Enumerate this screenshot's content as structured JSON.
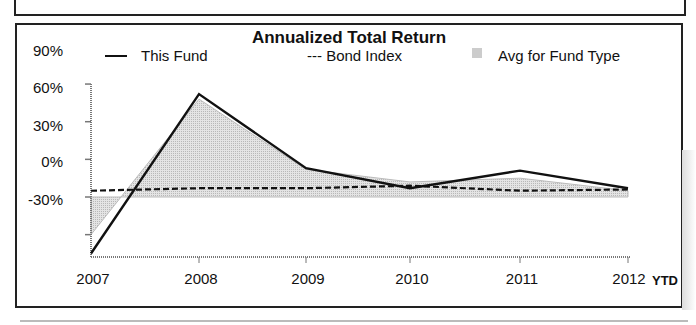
{
  "chart_data": {
    "type": "line",
    "title": "Annualized Total Return",
    "xlabel": "",
    "ylabel": "",
    "categories": [
      "2007",
      "2008",
      "2009",
      "2010",
      "2011",
      "2012"
    ],
    "x_suffix_label": "YTD",
    "yticks": [
      "90%",
      "60%",
      "30%",
      "0%",
      "-30%"
    ],
    "ylim": [
      -50,
      90
    ],
    "grid": false,
    "legend_position": "top",
    "series": [
      {
        "name": "This Fund",
        "style": "solid",
        "values": [
          -45,
          82,
          23,
          7,
          21,
          7
        ]
      },
      {
        "name": "Bond Index",
        "style": "dashed",
        "values": [
          5,
          7,
          7,
          9,
          5,
          6
        ]
      },
      {
        "name": "Avg for Fund Type",
        "style": "area",
        "values": [
          -30,
          78,
          22,
          12,
          15,
          5
        ]
      }
    ]
  },
  "legend": {
    "fund_label": "This Fund",
    "fund_marker": "—",
    "bond_label": "--- Bond Index",
    "avg_label": "Avg for Fund Type"
  }
}
